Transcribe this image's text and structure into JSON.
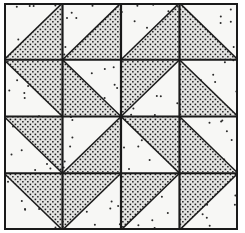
{
  "diagram": {
    "type": "quilt-block",
    "rows": 4,
    "cols": 4,
    "colors": {
      "border": "#1a1a1a",
      "light_fill": "#f7f7f5",
      "dark_fill": "#d6d6d4",
      "stipple": "#1e1e1e",
      "sparse_dot": "#2a2a2a"
    },
    "cells": [
      [
        "bottom-right",
        "bottom-right",
        "bottom-right",
        "bottom-left"
      ],
      [
        "top-right",
        "bottom-left",
        "top-left",
        "bottom-left"
      ],
      [
        "top-right",
        "bottom-right",
        "top-right",
        "bottom-left"
      ],
      [
        "top-right",
        "top-left",
        "top-left",
        "top-left"
      ]
    ]
  }
}
